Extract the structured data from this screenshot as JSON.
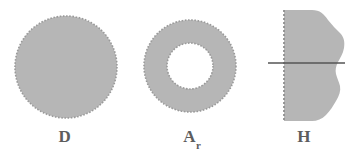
{
  "figure": {
    "width": 354,
    "height": 159,
    "background": "#ffffff",
    "fill_color": "#b6b6b6",
    "boundary_color": "#9a9a9a",
    "line_color": "#555555",
    "label_color": "#5d5d5d"
  },
  "panels": [
    {
      "key": "disk",
      "label": "D",
      "label_sub": "",
      "shape_name": "filled-disk",
      "description": "filled disk with dashed circular boundary",
      "geometry": {
        "center_x": 66,
        "center_y": 67,
        "radius": 51
      }
    },
    {
      "key": "annulus",
      "label": "A",
      "label_sub": "r",
      "shape_name": "annulus",
      "description": "annulus: filled ring with dashed outer and inner circular boundaries",
      "geometry": {
        "center_x": 60,
        "center_y": 66,
        "outer_radius": 46,
        "inner_radius": 23
      }
    },
    {
      "key": "halfplane",
      "label": "H",
      "label_sub": "",
      "shape_name": "half-plane-blob",
      "description": "irregular blob bounded on the left by a dashed vertical line, crossed by a solid horizontal line",
      "geometry": {
        "dashed_edge_x": 30,
        "blob_top_y": 10,
        "blob_bottom_y": 121,
        "horizontal_line_y": 63,
        "horizontal_line_x_start": 14,
        "horizontal_line_x_end": 91
      }
    }
  ]
}
